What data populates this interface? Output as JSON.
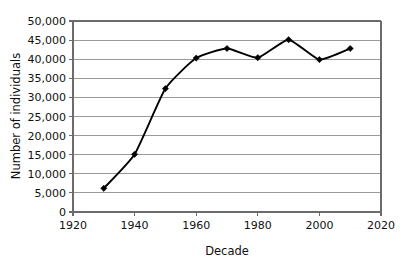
{
  "chart_data": {
    "type": "line",
    "title": "",
    "subtitle": "",
    "xlabel": "Decade",
    "ylabel": "Number of individuals",
    "x": [
      1930,
      1940,
      1950,
      1960,
      1970,
      1980,
      1990,
      2000,
      2010
    ],
    "values": [
      6200,
      15100,
      32300,
      40300,
      42800,
      40400,
      45100,
      39900,
      42800
    ],
    "series": [
      {
        "name": "Number of individuals",
        "values": [
          6200,
          15100,
          32300,
          40300,
          42800,
          40400,
          45100,
          39900,
          42800
        ]
      }
    ],
    "xlim": [
      1920,
      2020
    ],
    "ylim": [
      0,
      50000
    ],
    "xticks": [
      1920,
      1940,
      1960,
      1980,
      2000,
      2020
    ],
    "xtick_labels": [
      "1920",
      "1940",
      "1960",
      "1980",
      "2000",
      "2020"
    ],
    "yticks": [
      0,
      5000,
      10000,
      15000,
      20000,
      25000,
      30000,
      35000,
      40000,
      45000,
      50000
    ],
    "ytick_labels": [
      "0",
      "5,000",
      "10,000",
      "15,000",
      "20,000",
      "25,000",
      "30,000",
      "35,000",
      "40,000",
      "45,000",
      "50,000"
    ],
    "grid": "horizontal",
    "legend": "none",
    "marker": "diamond",
    "line_color": "#000000",
    "marker_color": "#000000",
    "gridline_color": "#9a9a9a",
    "background": "#ffffff",
    "smoothing": true,
    "annotations": []
  }
}
